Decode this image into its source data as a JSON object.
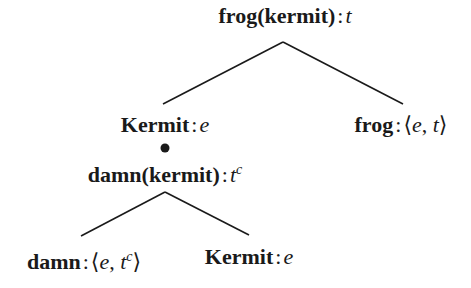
{
  "diagram": {
    "type": "semantic-composition-tree",
    "line_color": "#1a1a1a",
    "nodes": {
      "root": {
        "expr": "frog(kermit)",
        "sep": ":",
        "type": "t",
        "type_sup": ""
      },
      "left": {
        "expr": "Kermit",
        "sep": ":",
        "type": "e"
      },
      "right": {
        "expr": "frog",
        "sep": ":",
        "type_open": "⟨",
        "type_a": "e",
        "type_comma": ",",
        "type_b": "t",
        "type_close": "⟩"
      },
      "ci": {
        "expr": "damn(kermit)",
        "sep": ":",
        "type": "t",
        "type_sup": "c"
      },
      "ci_left": {
        "expr": "damn",
        "sep": ":",
        "type_open": "⟨",
        "type_a": "e",
        "type_comma": ",",
        "type_b": "t",
        "type_b_sup": "c",
        "type_close": "⟩"
      },
      "ci_right": {
        "expr": "Kermit",
        "sep": ":",
        "type": "e"
      }
    },
    "bullet": "•"
  }
}
